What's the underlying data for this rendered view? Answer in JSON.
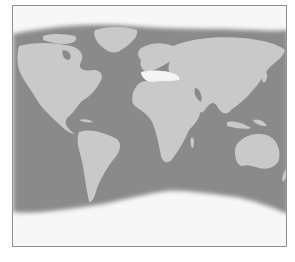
{
  "map": {
    "type": "world-map",
    "projection": "equirectangular-cropped",
    "colors": {
      "background": "#f7f7f7",
      "ocean": "#8a8a8a",
      "land": "#c9c9c9",
      "highlight": "#f4f4f4",
      "border": "#8f8f8f"
    },
    "highlighted_region": "mediterranean",
    "regions": [
      "north-america",
      "south-america",
      "europe",
      "africa",
      "asia",
      "australia",
      "greenland"
    ]
  }
}
